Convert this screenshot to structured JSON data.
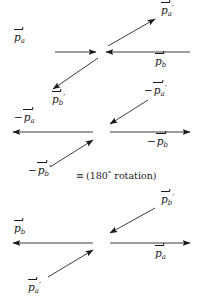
{
  "figure": {
    "type": "physics-vector-diagram",
    "stroke_color": "#1a1a1a",
    "background": "#ffffff",
    "width": 201,
    "height": 307
  },
  "annotation": {
    "equivalence_symbol": "≡",
    "text": "(180° rotation)",
    "open_paren": "(",
    "value": "180",
    "degree": "°",
    "word": "rotation",
    "close_paren": ")"
  },
  "symbols": {
    "p": "p",
    "minus": "−",
    "prime": "′",
    "sub_a": "a",
    "sub_b": "b"
  },
  "diagram_top": {
    "name": "original-collision",
    "vectors": [
      {
        "id": "p-a-in",
        "label_minus": "",
        "label_p": "p",
        "label_sub": "a",
        "label_prime": "",
        "direction": "right",
        "role": "incoming-particle-a"
      },
      {
        "id": "p-b-in",
        "label_minus": "",
        "label_p": "p",
        "label_sub": "b",
        "label_prime": "",
        "direction": "left",
        "role": "incoming-particle-b"
      },
      {
        "id": "p-a-out",
        "label_minus": "",
        "label_p": "p",
        "label_sub": "a",
        "label_prime": "′",
        "direction": "up-right",
        "role": "outgoing-particle-a"
      },
      {
        "id": "p-b-out",
        "label_minus": "",
        "label_p": "p",
        "label_sub": "b",
        "label_prime": "′",
        "direction": "down-left",
        "role": "outgoing-particle-b"
      }
    ]
  },
  "diagram_middle": {
    "name": "negated-collision",
    "vectors": [
      {
        "id": "neg-p-a-in",
        "label_minus": "−",
        "label_p": "p",
        "label_sub": "a",
        "label_prime": "",
        "direction": "left",
        "role": "negated-incoming-particle-a"
      },
      {
        "id": "neg-p-b-in",
        "label_minus": "−",
        "label_p": "p",
        "label_sub": "b",
        "label_prime": "",
        "direction": "right",
        "role": "negated-incoming-particle-b"
      },
      {
        "id": "neg-p-a-out",
        "label_minus": "−",
        "label_p": "p",
        "label_sub": "a",
        "label_prime": "′",
        "direction": "down-left",
        "role": "negated-outgoing-particle-a"
      },
      {
        "id": "neg-p-b-out",
        "label_minus": "−",
        "label_p": "p",
        "label_sub": "b",
        "label_prime": "′",
        "direction": "up-right",
        "role": "negated-outgoing-particle-b"
      }
    ]
  },
  "diagram_bottom": {
    "name": "rotated-collision",
    "vectors": [
      {
        "id": "rot-p-b",
        "label_minus": "",
        "label_p": "p",
        "label_sub": "b",
        "label_prime": "",
        "direction": "left",
        "role": "rotated-particle-b"
      },
      {
        "id": "rot-p-a",
        "label_minus": "",
        "label_p": "p",
        "label_sub": "a",
        "label_prime": "",
        "direction": "right",
        "role": "rotated-particle-a"
      },
      {
        "id": "rot-p-b-out",
        "label_minus": "",
        "label_p": "p",
        "label_sub": "b",
        "label_prime": "′",
        "direction": "down-left",
        "role": "rotated-outgoing-particle-b"
      },
      {
        "id": "rot-p-a-out",
        "label_minus": "",
        "label_p": "p",
        "label_sub": "a",
        "label_prime": "′",
        "direction": "up-right",
        "role": "rotated-outgoing-particle-a"
      }
    ]
  }
}
